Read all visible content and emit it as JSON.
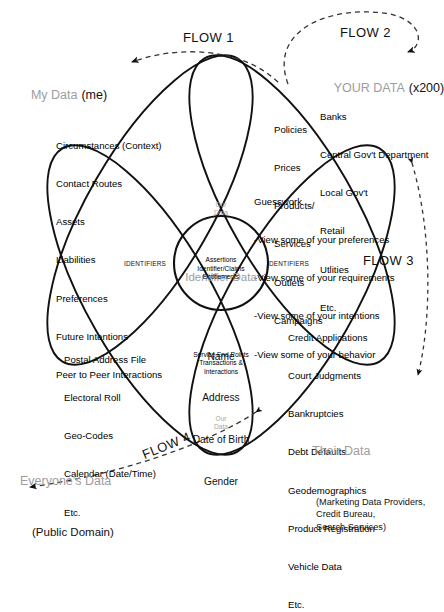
{
  "diagram": {
    "flows": [
      {
        "id": "flow1",
        "label": "FLOW 1"
      },
      {
        "id": "flow2",
        "label": "FLOW 2"
      },
      {
        "id": "flow3",
        "label": "FLOW 3"
      },
      {
        "id": "flow4",
        "label": "FLOW 4"
      }
    ],
    "petals": {
      "my_data": {
        "heading_gray": "My Data",
        "heading_black": "(me)",
        "items": [
          "Circumstances (Context)",
          "Contact Routes",
          "Assets",
          "Liabilities",
          "Preferences",
          "Future Intentions",
          "Peer to Peer Interactions"
        ]
      },
      "your_data": {
        "heading_gray": "YOUR DATA",
        "heading_black": "(x200)",
        "items": [
          "Banks",
          "Central Gov't Department",
          "Local Gov't",
          "Retail",
          "Utlities",
          "Etc."
        ],
        "offer_items": [
          "Policies",
          "Prices",
          "Products/",
          "Services",
          "Outlets",
          "Campaigns"
        ],
        "guesswork_title": "Guesswork",
        "guesswork_items": [
          "-View some of your preferences",
          "-View some of your requirements",
          "-View some of your intentions",
          "-View some of your behavior"
        ]
      },
      "everyones_data": {
        "heading_gray": "Everyone's Data",
        "heading_black": "(Public Domain)",
        "items": [
          "Postal Address File",
          "Electoral Roll",
          "Geo-Codes",
          "Calendar (Date/Time)",
          "Etc."
        ]
      },
      "their_data": {
        "heading_gray": "Their Data",
        "heading_black": "(Marketing Data Providers,\nCredit Bureau,\nSearch Services)",
        "items": [
          "Credit Applications",
          "Court Judgments",
          "Bankruptcies",
          "Debt Defaults",
          "Geodemographics",
          "Product Registration",
          "Vehicle Data",
          "Etc."
        ]
      }
    },
    "center": {
      "heading_gray": "Identifier Data",
      "items": [
        "Name",
        "Address",
        "Date of Birth",
        "Gender"
      ]
    },
    "upper_overlap": {
      "gray_lines": "Our\nData",
      "black_lines": "Assertions\nIdentifier/Claims\nEntitlements"
    },
    "lower_overlap": {
      "black_lines": "Service End Points\nTransactions &\nInteractions",
      "gray_lines": "Our\nData"
    },
    "identifiers_left": "IDENTIFIERS",
    "identifiers_right": "IDENTIFIERS",
    "colors": {
      "stroke": "#111111",
      "gray_text": "#9d9d9d",
      "background": "#ffffff"
    }
  }
}
